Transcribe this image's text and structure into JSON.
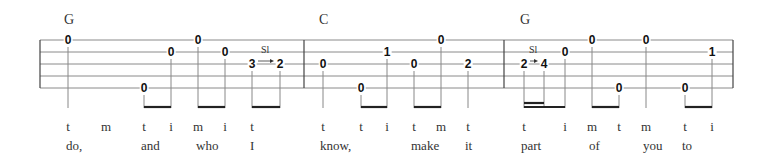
{
  "staff": {
    "left_x": 40,
    "right_x": 733,
    "string_y": [
      40,
      52,
      64,
      76,
      88
    ],
    "barlines_x": [
      40,
      304,
      504,
      733
    ]
  },
  "measures": [
    {
      "chord": {
        "label": "G",
        "x": 64
      },
      "notes": [
        {
          "fret": "0",
          "string": 1,
          "x": 68,
          "finger": "t",
          "lyric": "do,"
        },
        {
          "fret": "",
          "string": 0,
          "x": 105,
          "finger": "m",
          "lyric": ""
        },
        {
          "fret": "0",
          "string": 5,
          "x": 144,
          "finger": "t",
          "lyric": "and"
        },
        {
          "fret": "0",
          "string": 2,
          "x": 171,
          "finger": "i",
          "lyric": ""
        },
        {
          "fret": "0",
          "string": 1,
          "x": 198,
          "finger": "m",
          "lyric": "who"
        },
        {
          "fret": "0",
          "string": 2,
          "x": 225,
          "finger": "i",
          "lyric": ""
        },
        {
          "fret": "3",
          "string": 3,
          "x": 252,
          "finger": "t",
          "lyric": "I"
        },
        {
          "fret": "2",
          "string": 3,
          "x": 280,
          "finger": "",
          "lyric": ""
        }
      ],
      "slide": {
        "label": "Sl",
        "from_x": 252,
        "to_x": 280,
        "string": 3
      },
      "beams": [
        {
          "x1": 144,
          "x2": 171,
          "double_to": null
        },
        {
          "x1": 198,
          "x2": 225,
          "double_to": null
        },
        {
          "x1": 252,
          "x2": 280,
          "double_to": null
        }
      ]
    },
    {
      "chord": {
        "label": "C",
        "x": 319
      },
      "notes": [
        {
          "fret": "0",
          "string": 3,
          "x": 323,
          "finger": "t",
          "lyric": "know,"
        },
        {
          "fret": "0",
          "string": 5,
          "x": 361,
          "finger": "t",
          "lyric": ""
        },
        {
          "fret": "1",
          "string": 2,
          "x": 387,
          "finger": "i",
          "lyric": ""
        },
        {
          "fret": "0",
          "string": 3,
          "x": 414,
          "finger": "t",
          "lyric": "make"
        },
        {
          "fret": "0",
          "string": 1,
          "x": 441,
          "finger": "m",
          "lyric": ""
        },
        {
          "fret": "2",
          "string": 3,
          "x": 468,
          "finger": "t",
          "lyric": "it"
        }
      ],
      "beams": [
        {
          "x1": 361,
          "x2": 387,
          "double_to": null
        },
        {
          "x1": 414,
          "x2": 441,
          "double_to": null
        }
      ]
    },
    {
      "chord": {
        "label": "G",
        "x": 520
      },
      "notes": [
        {
          "fret": "2",
          "string": 3,
          "x": 524,
          "finger": "t",
          "lyric": "part"
        },
        {
          "fret": "4",
          "string": 3,
          "x": 544,
          "finger": "",
          "lyric": ""
        },
        {
          "fret": "0",
          "string": 2,
          "x": 565,
          "finger": "i",
          "lyric": ""
        },
        {
          "fret": "0",
          "string": 1,
          "x": 592,
          "finger": "m",
          "lyric": "of"
        },
        {
          "fret": "0",
          "string": 5,
          "x": 619,
          "finger": "t",
          "lyric": ""
        },
        {
          "fret": "0",
          "string": 1,
          "x": 646,
          "finger": "m",
          "lyric": "you"
        },
        {
          "fret": "0",
          "string": 5,
          "x": 685,
          "finger": "t",
          "lyric": "to"
        },
        {
          "fret": "1",
          "string": 2,
          "x": 712,
          "finger": "i",
          "lyric": ""
        }
      ],
      "slide": {
        "label": "Sl",
        "from_x": 524,
        "to_x": 544,
        "string": 3
      },
      "beams": [
        {
          "x1": 524,
          "x2": 565,
          "double_to": 544
        },
        {
          "x1": 592,
          "x2": 619,
          "double_to": null
        },
        {
          "x1": 685,
          "x2": 712,
          "double_to": null
        }
      ]
    }
  ],
  "layout": {
    "chord_y": 12,
    "beam_y": 107,
    "finger_y": 119,
    "lyric_y": 138,
    "lyric_positions": [
      {
        "text": "do,",
        "x": 66
      },
      {
        "text": "and",
        "x": 141
      },
      {
        "text": "who",
        "x": 196
      },
      {
        "text": "I",
        "x": 250
      },
      {
        "text": "know,",
        "x": 320
      },
      {
        "text": "make",
        "x": 411
      },
      {
        "text": "it",
        "x": 465
      },
      {
        "text": "part",
        "x": 521
      },
      {
        "text": "of",
        "x": 589
      },
      {
        "text": "you",
        "x": 643
      },
      {
        "text": "to",
        "x": 682
      }
    ],
    "finger_positions": [
      {
        "text": "t",
        "x": 68
      },
      {
        "text": "m",
        "x": 106
      },
      {
        "text": "t",
        "x": 144
      },
      {
        "text": "i",
        "x": 171
      },
      {
        "text": "m",
        "x": 198
      },
      {
        "text": "i",
        "x": 225
      },
      {
        "text": "t",
        "x": 252
      },
      {
        "text": "t",
        "x": 323
      },
      {
        "text": "t",
        "x": 361
      },
      {
        "text": "i",
        "x": 387
      },
      {
        "text": "t",
        "x": 414
      },
      {
        "text": "m",
        "x": 441
      },
      {
        "text": "t",
        "x": 468
      },
      {
        "text": "t",
        "x": 524
      },
      {
        "text": "i",
        "x": 565
      },
      {
        "text": "m",
        "x": 592
      },
      {
        "text": "t",
        "x": 619
      },
      {
        "text": "m",
        "x": 646
      },
      {
        "text": "t",
        "x": 685
      },
      {
        "text": "i",
        "x": 712
      }
    ]
  },
  "colors": {
    "string_line": "#8a8a8a",
    "barline": "#444444",
    "stem": "#888888",
    "beam": "#222222",
    "text": "#222222"
  }
}
